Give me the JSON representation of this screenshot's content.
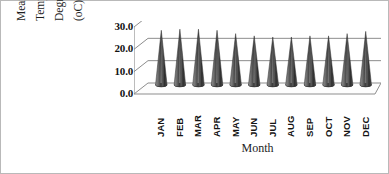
{
  "chart_data": {
    "type": "bar",
    "title": "",
    "xlabel": "Month",
    "ylabel": "Mean Maximum Temperature Degrees Centigrade (oC)",
    "ylabel_lines": [
      "Mean Maximum",
      "Temperature",
      "Degrees Centigrade",
      "(oC)"
    ],
    "categories": [
      "JAN",
      "FEB",
      "MAR",
      "APR",
      "MAY",
      "JUN",
      "JUL",
      "AUG",
      "SEP",
      "OCT",
      "NOV",
      "DEC"
    ],
    "values": [
      24.5,
      25.0,
      25.0,
      24.5,
      23.0,
      22.0,
      21.5,
      21.5,
      22.0,
      22.0,
      23.0,
      24.0
    ],
    "ylim": [
      0.0,
      30.0
    ],
    "ytick_labels": [
      "30.0",
      "20.0",
      "10.0",
      "0.0"
    ],
    "ytick_values": [
      30.0,
      20.0,
      10.0,
      0.0
    ],
    "grid": true,
    "legend": "none",
    "style_3d": true,
    "marker_shape": "cone",
    "series_color": "#4a4a4a"
  },
  "axis": {
    "x_title": "Month"
  }
}
